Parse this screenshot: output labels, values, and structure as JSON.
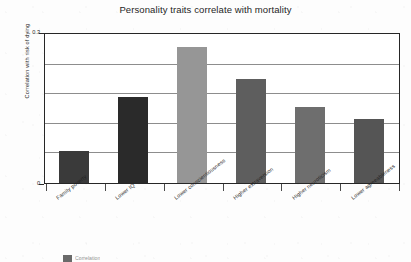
{
  "chart_data": {
    "type": "bar",
    "title": "Personality traits correlate with mortality",
    "xlabel": "",
    "ylabel": "Correlation with risk of dying",
    "categories": [
      "Family poverty",
      "Lower IQ",
      "Lower conscientiousness",
      "Higher extraversion",
      "Higher neuroticism",
      "Lower agreeableness"
    ],
    "values": [
      0.065,
      0.175,
      0.275,
      0.21,
      0.155,
      0.13
    ],
    "bar_colors": [
      "#3a3a3a",
      "#2a2a2a",
      "#969696",
      "#5e5e5e",
      "#6e6e6e",
      "#555555"
    ],
    "ylim": [
      0,
      0.3
    ],
    "ytick_labels": [
      "0.3",
      "0"
    ],
    "ytick_values": [
      0.3,
      0
    ],
    "gridlines": [
      0.06,
      0.12,
      0.18,
      0.24
    ],
    "grid": true,
    "legend_position": "bottom",
    "legend_entries": [
      "Correlation"
    ]
  },
  "legend": {
    "swatch_label": "Correlation"
  }
}
